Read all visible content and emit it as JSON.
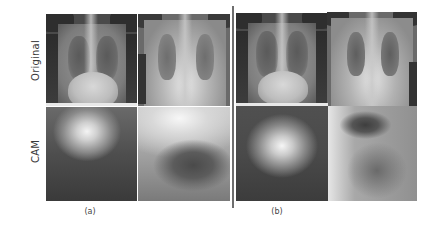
{
  "figure": {
    "row_labels": {
      "original": "Original",
      "cam": "CAM"
    },
    "captions": {
      "a": "(a)",
      "b": "(b)"
    },
    "groups": [
      {
        "caption": "(a)",
        "panels": [
          {
            "row": "Original",
            "col": 1,
            "description": "chest x-ray, frontal view"
          },
          {
            "row": "Original",
            "col": 2,
            "description": "chest x-ray, frontal view, brighter"
          },
          {
            "row": "CAM",
            "col": 1,
            "description": "class activation map, bright spot upper center"
          },
          {
            "row": "CAM",
            "col": 2,
            "description": "class activation map, bright upper region, dark lower center"
          }
        ]
      },
      {
        "caption": "(b)",
        "panels": [
          {
            "row": "Original",
            "col": 1,
            "description": "chest x-ray, frontal view"
          },
          {
            "row": "Original",
            "col": 2,
            "description": "chest x-ray, frontal view, brighter"
          },
          {
            "row": "CAM",
            "col": 1,
            "description": "class activation map, bright spot center"
          },
          {
            "row": "CAM",
            "col": 2,
            "description": "class activation map, dark blob upper center"
          }
        ]
      }
    ]
  }
}
